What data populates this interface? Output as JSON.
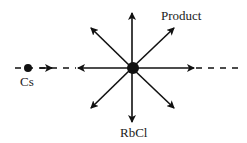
{
  "diagram": {
    "labels": {
      "product": "Product",
      "cs": "Cs",
      "rbcl": "RbCl"
    },
    "colors": {
      "stroke": "#111111",
      "background": "#ffffff"
    },
    "center": {
      "x": 132,
      "y": 68
    },
    "arrow_directions": [
      "N",
      "NE",
      "E",
      "SE",
      "S",
      "SW",
      "W",
      "NW"
    ]
  }
}
